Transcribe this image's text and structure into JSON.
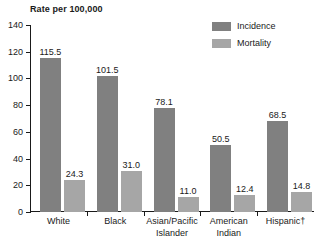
{
  "chart_data": {
    "type": "bar",
    "title": "Rate per 100,000",
    "xlabel": "",
    "ylabel": "Rate per 100,000",
    "ylim": [
      0,
      140
    ],
    "yticks": [
      0,
      20,
      40,
      60,
      80,
      100,
      120,
      140
    ],
    "grid": false,
    "legend_position": "top-right",
    "categories": [
      "White",
      "Black",
      "Asian/Pacific Islander",
      "American Indian",
      "Hispanic†"
    ],
    "category_lines": [
      [
        "White"
      ],
      [
        "Black"
      ],
      [
        "Asian/Pacific",
        "Islander"
      ],
      [
        "American",
        "Indian"
      ],
      [
        "Hispanic†"
      ]
    ],
    "series": [
      {
        "name": "Incidence",
        "color": "#808080",
        "values": [
          115.5,
          101.5,
          78.1,
          50.5,
          68.5
        ],
        "labels": [
          "115.5",
          "101.5",
          "78.1",
          "50.5",
          "68.5"
        ]
      },
      {
        "name": "Mortality",
        "color": "#a6a6a6",
        "values": [
          24.3,
          31.0,
          11.0,
          12.4,
          14.8
        ],
        "labels": [
          "24.3",
          "31.0",
          "11.0",
          "12.4",
          "14.8"
        ]
      }
    ]
  },
  "legend": {
    "items": [
      {
        "label": "Incidence",
        "color": "#808080"
      },
      {
        "label": "Mortality",
        "color": "#a6a6a6"
      }
    ]
  },
  "axis": {
    "tick_labels": [
      "140",
      "120",
      "100",
      "80",
      "60",
      "40",
      "20",
      "0"
    ]
  },
  "colors": {
    "incidence": "#808080",
    "mortality": "#a6a6a6",
    "axis": "#1a1a1a",
    "text": "#1a1a1a",
    "background": "#ffffff"
  }
}
